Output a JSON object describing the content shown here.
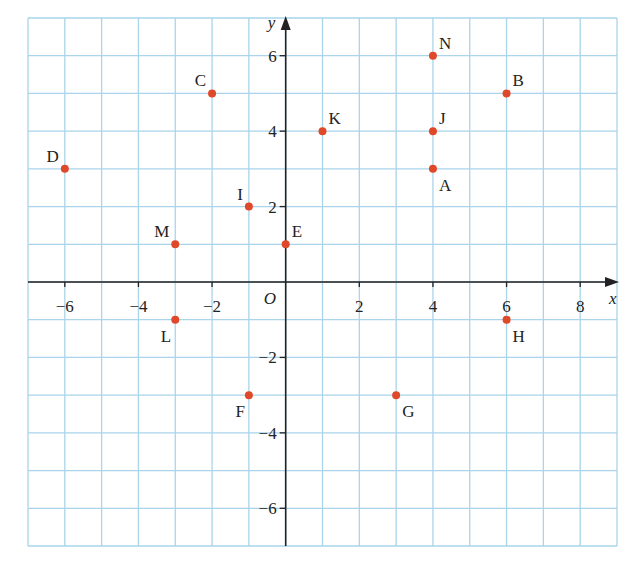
{
  "chart_data": {
    "type": "scatter",
    "title": "",
    "xlabel": "x",
    "ylabel": "y",
    "origin_label": "O",
    "xlim": [
      -7,
      9
    ],
    "ylim": [
      -7,
      7
    ],
    "grid": true,
    "x_ticks": [
      -6,
      -4,
      -2,
      2,
      4,
      6,
      8
    ],
    "y_ticks": [
      -6,
      -4,
      -2,
      2,
      4,
      6
    ],
    "points": [
      {
        "label": "A",
        "x": 4,
        "y": 3,
        "label_pos": "below-right"
      },
      {
        "label": "B",
        "x": 6,
        "y": 5,
        "label_pos": "above-right"
      },
      {
        "label": "C",
        "x": -2,
        "y": 5,
        "label_pos": "above-left"
      },
      {
        "label": "D",
        "x": -6,
        "y": 3,
        "label_pos": "above-left"
      },
      {
        "label": "E",
        "x": 0,
        "y": 1,
        "label_pos": "above-right"
      },
      {
        "label": "F",
        "x": -1,
        "y": -3,
        "label_pos": "below-left"
      },
      {
        "label": "G",
        "x": 3,
        "y": -3,
        "label_pos": "below-right"
      },
      {
        "label": "H",
        "x": 6,
        "y": -1,
        "label_pos": "below-right"
      },
      {
        "label": "I",
        "x": -1,
        "y": 2,
        "label_pos": "above-left"
      },
      {
        "label": "J",
        "x": 4,
        "y": 4,
        "label_pos": "above-right"
      },
      {
        "label": "K",
        "x": 1,
        "y": 4,
        "label_pos": "above-right"
      },
      {
        "label": "L",
        "x": -3,
        "y": -1,
        "label_pos": "below-left"
      },
      {
        "label": "M",
        "x": -3,
        "y": 1,
        "label_pos": "above-left"
      },
      {
        "label": "N",
        "x": 4,
        "y": 6,
        "label_pos": "above-right"
      }
    ]
  },
  "colors": {
    "grid": "#a9d4ea",
    "axis": "#222222",
    "point": "#e0482a",
    "background": "#ffffff"
  }
}
